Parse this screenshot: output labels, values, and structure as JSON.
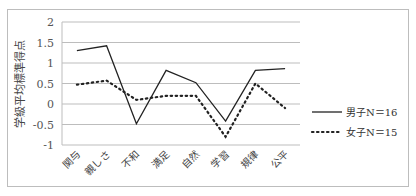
{
  "chart_data": {
    "type": "line",
    "title": "",
    "xlabel": "",
    "ylabel": "学級平均標準得点",
    "ylim": [
      -1,
      2
    ],
    "yticks": [
      2,
      1.5,
      1,
      0.5,
      0,
      -0.5,
      -1
    ],
    "ytick_labels": [
      "2",
      "1.5",
      "1",
      "0.5",
      "0",
      "-0.5",
      "-1"
    ],
    "grid": true,
    "legend_position": "right",
    "categories": [
      "関与",
      "親しさ",
      "不和",
      "満足",
      "自然",
      "学習",
      "規律",
      "公平"
    ],
    "series": [
      {
        "name": "男子N＝16",
        "style": "solid",
        "color": "#222222",
        "values": [
          1.3,
          1.42,
          -0.48,
          0.82,
          0.52,
          -0.42,
          0.82,
          0.86
        ]
      },
      {
        "name": "女子N＝15",
        "style": "dotted",
        "color": "#222222",
        "values": [
          0.47,
          0.57,
          0.1,
          0.2,
          0.2,
          -0.8,
          0.5,
          -0.1
        ]
      }
    ]
  }
}
